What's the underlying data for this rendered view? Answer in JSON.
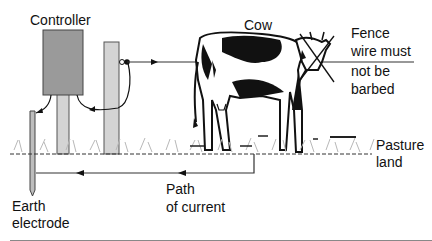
{
  "diagram": {
    "type": "electric-fence-circuit",
    "labels": {
      "controller": "Controller",
      "cow": "Cow",
      "fence_note_lines": [
        "Fence",
        "wire must",
        "not be",
        "barbed"
      ],
      "pasture_lines": [
        "Pasture",
        "land"
      ],
      "path_lines": [
        "Path",
        "of current"
      ],
      "earth_lines": [
        "Earth",
        "electrode"
      ]
    },
    "components": [
      {
        "id": "controller",
        "label": "Controller",
        "kind": "box"
      },
      {
        "id": "fence-post",
        "kind": "post"
      },
      {
        "id": "insulator",
        "kind": "connector"
      },
      {
        "id": "fence-wire",
        "kind": "wire",
        "note": "Fence wire must not be barbed"
      },
      {
        "id": "cow",
        "label": "Cow",
        "kind": "animal"
      },
      {
        "id": "ground",
        "label": "Pasture land",
        "kind": "surface"
      },
      {
        "id": "earth-electrode",
        "label": "Earth electrode",
        "kind": "rod"
      },
      {
        "id": "return-path",
        "label": "Path of current",
        "kind": "arrow-path"
      }
    ],
    "colors": {
      "controller_fill": "#9a9a9a",
      "post_fill": "#d4d4d4",
      "line": "#222222",
      "grass": "#b8b8b8"
    }
  }
}
